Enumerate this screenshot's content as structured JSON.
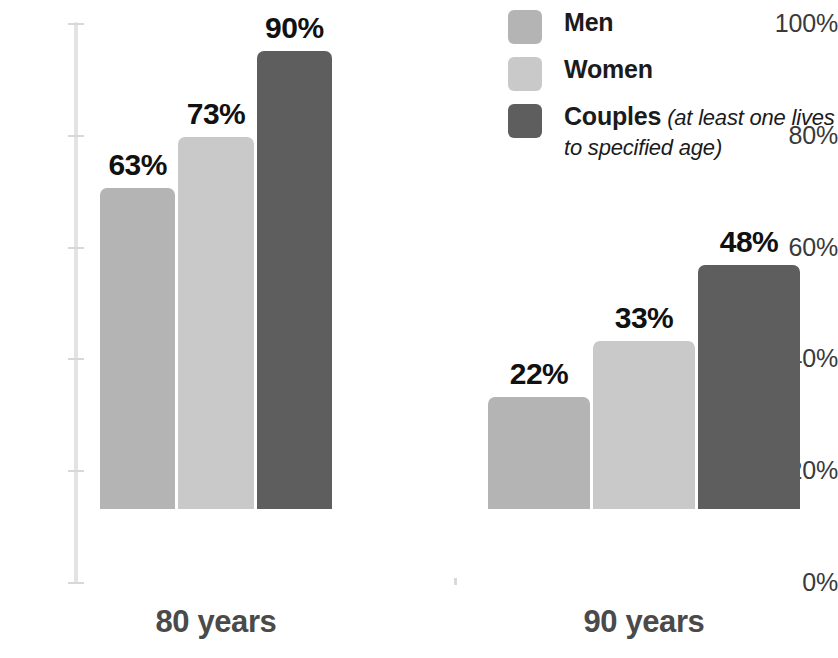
{
  "chart_data": {
    "type": "bar",
    "title": "",
    "subtitle": "",
    "xlabel": "",
    "ylabel": "",
    "ylim": [
      0,
      100
    ],
    "grid": false,
    "legend_position": "top-right",
    "categories": [
      "80 years",
      "90 years"
    ],
    "y_ticks": [
      "0%",
      "20%",
      "40%",
      "60%",
      "80%",
      "100%"
    ],
    "y_tick_values": [
      0,
      20,
      40,
      60,
      80,
      100
    ],
    "series": [
      {
        "name": "Men",
        "color": "#b4b4b4",
        "values": [
          63,
          22
        ],
        "labels": [
          "63%",
          "22%"
        ]
      },
      {
        "name": "Women",
        "color": "#c9c9c9",
        "values": [
          73,
          33
        ],
        "labels": [
          "73%",
          "33%"
        ]
      },
      {
        "name": "Couples",
        "color": "#5e5e5e",
        "values": [
          90,
          48
        ],
        "labels": [
          "90%",
          "48%"
        ]
      }
    ]
  },
  "legend": {
    "items": [
      {
        "label": "Men",
        "note": "",
        "color": "#b4b4b4"
      },
      {
        "label": "Women",
        "note": "",
        "color": "#c9c9c9"
      },
      {
        "label": "Couples",
        "note": " (at least one lives to specified age)",
        "color": "#5e5e5e"
      }
    ]
  },
  "axis": {
    "y_labels": [
      "100%",
      "80%",
      "60%",
      "40%",
      "20%",
      "0%"
    ],
    "line_color": "#e3e3e3"
  },
  "colors": {
    "men": "#b4b4b4",
    "women": "#c9c9c9",
    "couples": "#5e5e5e",
    "value_label": "#111111",
    "category_label": "#4a4a4a",
    "tick_label": "#3a3a3a",
    "background": "#ffffff"
  }
}
